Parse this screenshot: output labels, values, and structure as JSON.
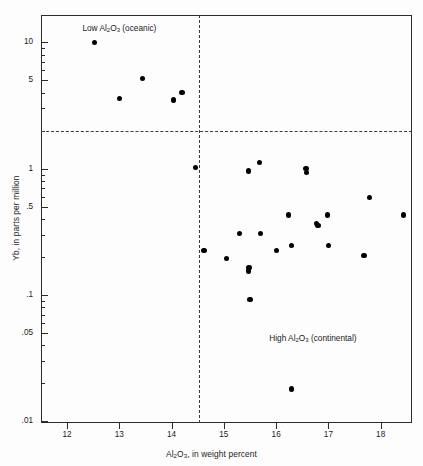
{
  "figure": {
    "background": "#fdfdfd",
    "frame_color": "#2b2b2b",
    "marker_color": "#000000",
    "dash_color": "#3a3a3a"
  },
  "axes": {
    "x": {
      "label_html": "Al<sub>2</sub>O<sub>3</sub>, in weight percent",
      "ticks": [
        "12",
        "13",
        "14",
        "15",
        "16",
        "17",
        "18"
      ],
      "tick_values": [
        12,
        13,
        14,
        15,
        16,
        17,
        18
      ],
      "range": [
        11.5,
        18.6
      ],
      "scale": "linear"
    },
    "y": {
      "label": "Yb, in parts per million",
      "ticks": [
        "10",
        "5",
        "1",
        ".5",
        ".1",
        ".05",
        ".01"
      ],
      "tick_values": [
        10,
        5,
        1,
        0.5,
        0.1,
        0.05,
        0.01
      ],
      "range": [
        0.0097,
        16.5
      ],
      "scale": "log"
    }
  },
  "annotations": [
    {
      "id": "oceanic",
      "html": "Low Al<sub>2</sub>O<sub>3</sub> (oceanic)",
      "x": 13.0,
      "y": 13.0
    },
    {
      "id": "continental",
      "html": "High Al<sub>2</sub>O<sub>3</sub> (continental)",
      "x": 16.7,
      "y": 0.046
    }
  ],
  "dividers": {
    "horizontal_y": 2.0,
    "vertical_x": 14.53
  },
  "chart_data": {
    "type": "scatter",
    "title": "",
    "xlabel": "Al2O3, in weight percent",
    "ylabel": "Yb, in parts per million",
    "xlim": [
      11.5,
      18.6
    ],
    "ylim": [
      0.0097,
      16.5
    ],
    "yscale": "log",
    "xscale": "linear",
    "grid": false,
    "legend": "none",
    "reference_lines": [
      {
        "orientation": "horizontal",
        "value": 2.0,
        "style": "dashed"
      },
      {
        "orientation": "vertical",
        "value": 14.53,
        "style": "dashed"
      }
    ],
    "groups": [
      {
        "name": "Low Al2O3 (oceanic)",
        "points": [
          {
            "x": 12.52,
            "y": 10.0
          },
          {
            "x": 13.0,
            "y": 3.6
          },
          {
            "x": 13.45,
            "y": 5.2
          },
          {
            "x": 14.03,
            "y": 3.5
          },
          {
            "x": 14.2,
            "y": 4.0
          }
        ]
      },
      {
        "name": "High Al2O3 (continental)",
        "points": [
          {
            "x": 14.45,
            "y": 1.02
          },
          {
            "x": 14.62,
            "y": 0.225
          },
          {
            "x": 15.05,
            "y": 0.195
          },
          {
            "x": 15.3,
            "y": 0.305
          },
          {
            "x": 15.47,
            "y": 0.96
          },
          {
            "x": 15.47,
            "y": 0.155
          },
          {
            "x": 15.48,
            "y": 0.165
          },
          {
            "x": 15.5,
            "y": 0.092
          },
          {
            "x": 15.68,
            "y": 1.12
          },
          {
            "x": 15.7,
            "y": 0.305
          },
          {
            "x": 16.0,
            "y": 0.225
          },
          {
            "x": 16.23,
            "y": 0.43
          },
          {
            "x": 16.3,
            "y": 0.245
          },
          {
            "x": 16.3,
            "y": 0.018
          },
          {
            "x": 16.57,
            "y": 1.0
          },
          {
            "x": 16.58,
            "y": 0.93
          },
          {
            "x": 16.78,
            "y": 0.37
          },
          {
            "x": 16.8,
            "y": 0.355
          },
          {
            "x": 16.98,
            "y": 0.43
          },
          {
            "x": 17.0,
            "y": 0.245
          },
          {
            "x": 17.68,
            "y": 0.205
          },
          {
            "x": 17.78,
            "y": 0.59
          },
          {
            "x": 18.43,
            "y": 0.43
          }
        ]
      }
    ]
  }
}
